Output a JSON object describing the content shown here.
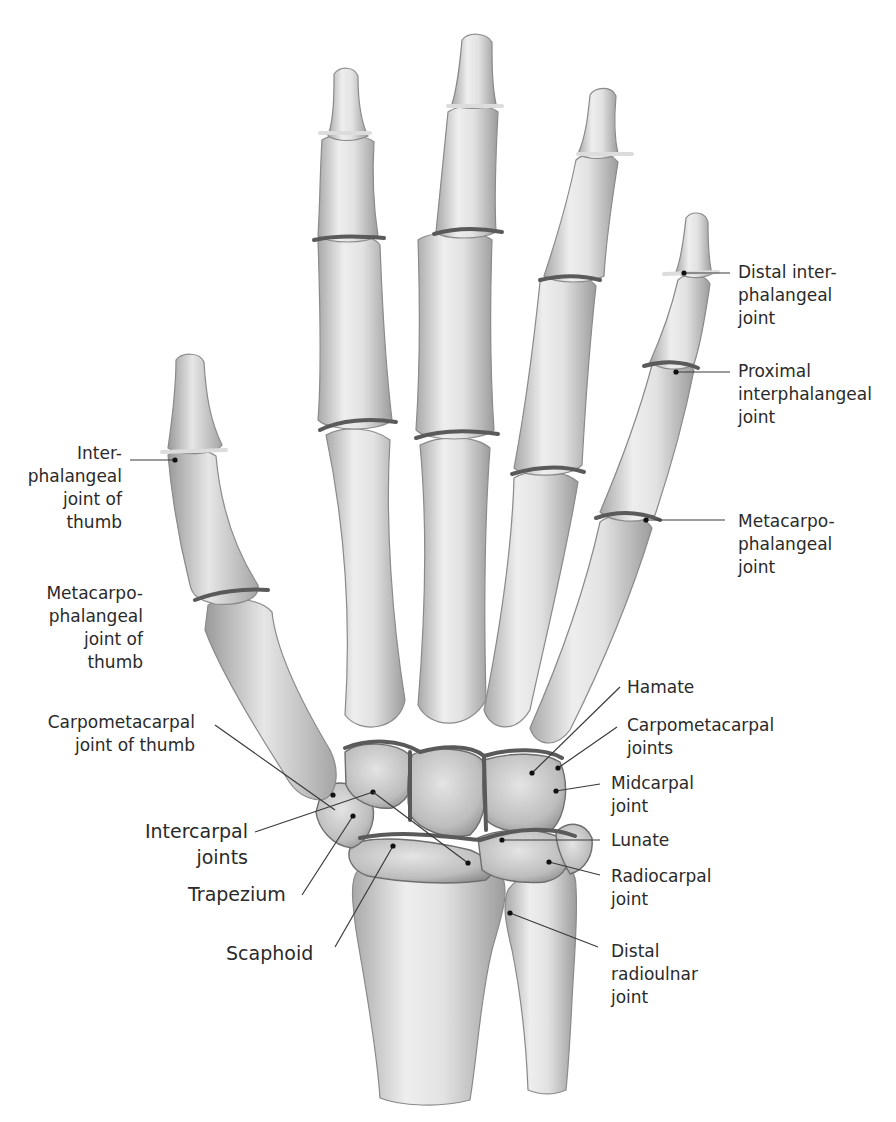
{
  "figure": {
    "background_color": "#ffffff",
    "bone_color": "#d9d9d9",
    "joint_line_color": "#5a5a5a",
    "label_color": "#2a2a2a"
  },
  "labels": {
    "distal_ip": "Distal inter-\nphalangeal\njoint",
    "proximal_ip": "Proximal\ninterphalangeal\njoint",
    "mcp": "Metacarpo-\nphalangeal\njoint",
    "ip_thumb": "Inter-\nphalangeal\njoint of\nthumb",
    "mcp_thumb": "Metacarpo-\nphalangeal\njoint of\nthumb",
    "cmc_thumb": "Carpometacarpal\njoint of thumb",
    "intercarpal": "Intercarpal\njoints",
    "trapezium": "Trapezium",
    "scaphoid": "Scaphoid",
    "hamate": "Hamate",
    "cmc_joints": "Carpometacarpal\njoints",
    "midcarpal": "Midcarpal\njoint",
    "lunate": "Lunate",
    "radiocarpal": "Radiocarpal\njoint",
    "distal_radioulnar": "Distal\nradioulnar\njoint"
  }
}
